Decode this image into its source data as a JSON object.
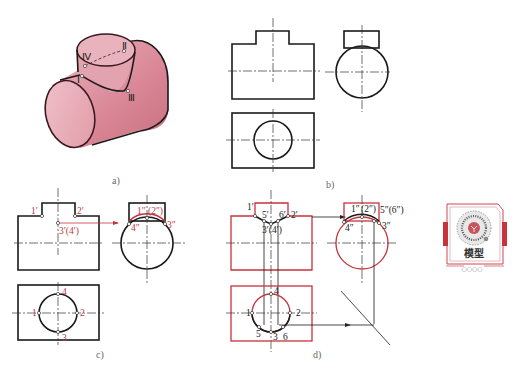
{
  "figure": {
    "panels": [
      {
        "id": "a",
        "caption": "a)",
        "description": "Isometric view of two intersecting cylinders (T-pipe)",
        "points": [
          "Ⅰ",
          "Ⅱ",
          "Ⅲ",
          "Ⅳ"
        ]
      },
      {
        "id": "b",
        "caption": "b)",
        "description": "Three orthographic views: front, side, top"
      },
      {
        "id": "c",
        "caption": "c)",
        "front_labels": [
          "1′",
          "2′",
          "3′(4′)"
        ],
        "side_labels": [
          "1″",
          "(2″)",
          "4″",
          "3″"
        ],
        "top_labels": [
          "1",
          "2",
          "3",
          "4"
        ]
      },
      {
        "id": "d",
        "caption": "d)",
        "front_labels": [
          "1′",
          "5′",
          "6′",
          "2′",
          "3′(4′)"
        ],
        "side_labels": [
          "1″",
          "(2″)",
          "5″(6″)",
          "4″",
          "3″"
        ],
        "top_labels": [
          "1",
          "2",
          "4",
          "5",
          "3",
          "6"
        ]
      }
    ],
    "colors": {
      "line": "#1a1a1a",
      "highlight": "#c8323c",
      "solid_fill": "#e7a9b4"
    }
  },
  "qr_card": {
    "title": "模型",
    "dots": "○○○○"
  }
}
